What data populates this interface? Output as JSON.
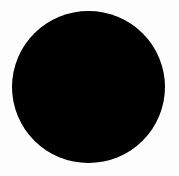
{
  "canvas": {
    "width": 179,
    "height": 176,
    "background_color": "#fdfdfd",
    "name": "black-circle-image"
  },
  "shape": {
    "type": "ellipse",
    "label": "black-filled-circle",
    "fill_color": "#000000",
    "stroke_color": "none",
    "stroke_width": 0,
    "center_x": 88.5,
    "center_y": 87,
    "radius_x": 76.5,
    "radius_y": 76,
    "bounds": {
      "left": 12,
      "top": 11,
      "right": 165,
      "bottom": 163,
      "width": 153,
      "height": 152
    },
    "edge_softness_px": 1.2,
    "opacity": 1
  },
  "accessibility": {
    "alt_text": "Solid black circle on a white background"
  }
}
